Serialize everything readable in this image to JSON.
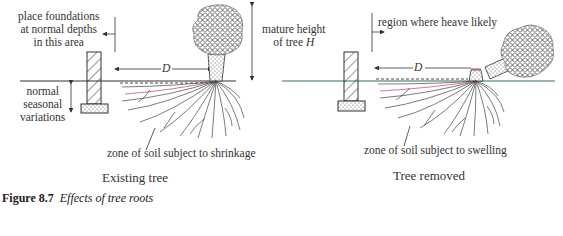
{
  "figure": {
    "number": "Figure 8.7",
    "title": "Effects of tree roots"
  },
  "left_panel": {
    "subtitle": "Existing tree",
    "labels": {
      "foundation_area_line1": "place foundations",
      "foundation_area_line2": "at normal depths",
      "foundation_area_line3": "in this area",
      "seasonal_line1": "normal",
      "seasonal_line2": "seasonal",
      "seasonal_line3": "variations",
      "height_line1": "mature height",
      "height_line2_prefix": "of tree ",
      "height_symbol": "H",
      "distance_symbol": "D",
      "zone": "zone of soil subject to shrinkage"
    }
  },
  "right_panel": {
    "subtitle": "Tree removed",
    "labels": {
      "heave_region": "region where heave likely",
      "distance_symbol": "D",
      "zone": "zone of soil subject to swelling"
    }
  },
  "colors": {
    "line": "#333333",
    "crown_fill": "#8a8a8a",
    "ground_line_right": "#3d6b5a",
    "root_red": "#d0405a",
    "root_cyan": "#40c0d0",
    "root_blue": "#5060c0"
  }
}
